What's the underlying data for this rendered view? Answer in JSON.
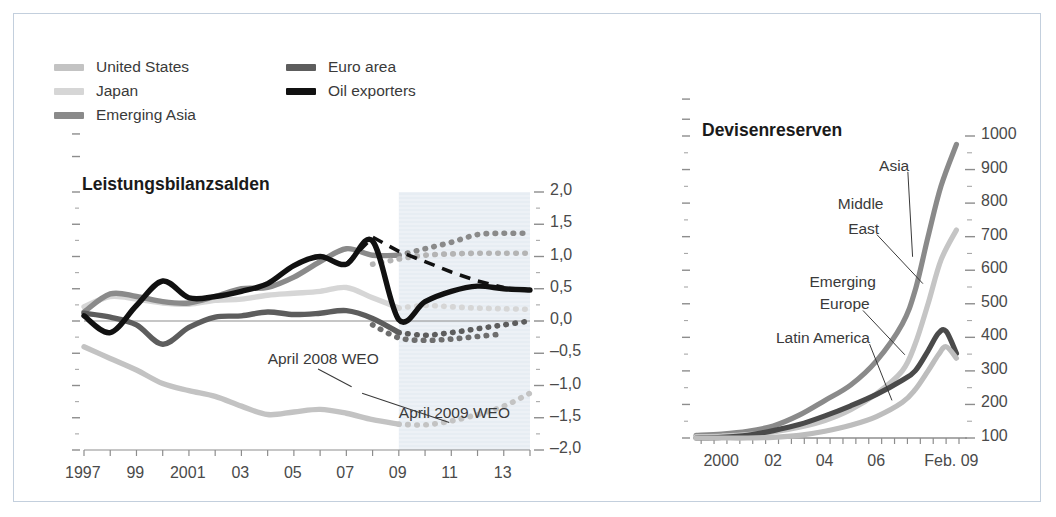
{
  "figure": {
    "border_color": "#c3cfdd",
    "background": "#ffffff"
  },
  "legend": {
    "items": [
      {
        "label": "United States",
        "color": "#c3c3c3",
        "col": 0,
        "row": 0
      },
      {
        "label": "Japan",
        "color": "#d6d6d6",
        "col": 0,
        "row": 1
      },
      {
        "label": "Emerging Asia",
        "color": "#8a8a8a",
        "col": 0,
        "row": 2
      },
      {
        "label": "Euro area",
        "color": "#5d5d5d",
        "col": 1,
        "row": 0
      },
      {
        "label": "Oil exporters",
        "color": "#111111",
        "col": 1,
        "row": 1
      }
    ]
  },
  "chart_data": [
    {
      "id": "leistungsbilanzsalden",
      "type": "line",
      "title": "Leistungsbilanzsalden",
      "xlabel": "",
      "ylabel": "",
      "xlim": [
        1997,
        2014
      ],
      "ylim": [
        -2.0,
        2.0
      ],
      "grid": false,
      "legend_position": "top-left-external",
      "decimal_separator": ",",
      "yticks": [
        2.0,
        1.5,
        1.0,
        0.5,
        0.0,
        -0.5,
        -1.0,
        -1.5,
        -2.0
      ],
      "ytick_labels": [
        "2,0",
        "1,5",
        "1,0",
        "0,5",
        "0,0",
        "-0,5",
        "-1,0",
        "-1,5",
        "-2,0"
      ],
      "xticks": [
        1997,
        1999,
        2001,
        2003,
        2005,
        2007,
        2009,
        2011,
        2013
      ],
      "xtick_labels": [
        "1997",
        "99",
        "2001",
        "03",
        "05",
        "07",
        "09",
        "11",
        "13"
      ],
      "forecast_shading": {
        "from": 2009,
        "to": 2014,
        "color": "#e7edf3"
      },
      "zero_line": 0.0,
      "annotations": [
        {
          "text": "April 2008 WEO",
          "x": 2004.0,
          "y": -0.62,
          "leader_to_x": 2007.2,
          "leader_to_y": -1.02
        },
        {
          "text": "April 2009 WEO",
          "x": 2009.0,
          "y": -1.45,
          "leader_to_x": 2007.6,
          "leader_to_y": -1.12
        }
      ],
      "series": [
        {
          "name": "United States",
          "color": "#c3c3c3",
          "style": "solid-then-dotted",
          "x": [
            1997,
            1998,
            1999,
            2000,
            2001,
            2002,
            2003,
            2004,
            2005,
            2006,
            2007,
            2008,
            2009,
            2010,
            2011,
            2012,
            2013,
            2014
          ],
          "values": [
            -0.4,
            -0.58,
            -0.76,
            -0.97,
            -1.08,
            -1.17,
            -1.32,
            -1.45,
            -1.41,
            -1.37,
            -1.43,
            -1.53,
            -1.6,
            -1.61,
            -1.55,
            -1.45,
            -1.32,
            -1.12
          ],
          "dotted_from": 2009
        },
        {
          "name": "Japan",
          "color": "#d6d6d6",
          "style": "solid-then-dotted",
          "x": [
            1997,
            1998,
            1999,
            2000,
            2001,
            2002,
            2003,
            2004,
            2005,
            2006,
            2007,
            2008,
            2009,
            2010,
            2011,
            2012,
            2013,
            2014
          ],
          "values": [
            0.22,
            0.38,
            0.34,
            0.28,
            0.26,
            0.32,
            0.34,
            0.4,
            0.43,
            0.46,
            0.52,
            0.36,
            0.2,
            0.24,
            0.22,
            0.2,
            0.19,
            0.18
          ],
          "dotted_from": 2009
        },
        {
          "name": "Emerging Asia",
          "color": "#8a8a8a",
          "style": "solid-then-dotted",
          "x": [
            1997,
            1998,
            1999,
            2000,
            2001,
            2002,
            2003,
            2004,
            2005,
            2006,
            2007,
            2008,
            2009,
            2010,
            2011,
            2012,
            2013,
            2014
          ],
          "values": [
            0.14,
            0.42,
            0.38,
            0.3,
            0.28,
            0.38,
            0.5,
            0.52,
            0.68,
            0.92,
            1.12,
            1.02,
            1.02,
            1.12,
            1.22,
            1.34,
            1.36,
            1.36
          ],
          "dotted_from": 2009
        },
        {
          "name": "Emerging Asia forecast 2009",
          "color": "#b4b4b4",
          "style": "dotted",
          "x": [
            2008,
            2009,
            2010,
            2011,
            2012,
            2013,
            2014
          ],
          "values": [
            0.88,
            0.96,
            1.02,
            1.04,
            1.05,
            1.05,
            1.05
          ]
        },
        {
          "name": "Euro area",
          "color": "#5d5d5d",
          "style": "solid-then-dotted",
          "x": [
            1997,
            1998,
            1999,
            2000,
            2001,
            2002,
            2003,
            2004,
            2005,
            2006,
            2007,
            2008,
            2009,
            2010,
            2011,
            2012,
            2013,
            2014
          ],
          "values": [
            0.12,
            0.06,
            -0.06,
            -0.36,
            -0.1,
            0.06,
            0.08,
            0.14,
            0.1,
            0.12,
            0.16,
            0.04,
            -0.18,
            -0.22,
            -0.18,
            -0.12,
            -0.06,
            0.0
          ],
          "dotted_from": 2009
        },
        {
          "name": "Euro area forecast 2009",
          "color": "#6e6e6e",
          "style": "dotted",
          "x": [
            2008,
            2009,
            2010,
            2011,
            2012,
            2013
          ],
          "values": [
            -0.06,
            -0.26,
            -0.3,
            -0.28,
            -0.24,
            -0.2
          ]
        },
        {
          "name": "Oil exporters",
          "color": "#111111",
          "style": "solid",
          "x": [
            1997,
            1998,
            1999,
            2000,
            2001,
            2002,
            2003,
            2004,
            2005,
            2006,
            2007,
            2008,
            2009,
            2010,
            2011,
            2012,
            2013,
            2014
          ],
          "values": [
            0.08,
            -0.18,
            0.24,
            0.62,
            0.36,
            0.38,
            0.46,
            0.58,
            0.86,
            1.0,
            0.88,
            1.24,
            0.02,
            0.3,
            0.46,
            0.54,
            0.5,
            0.48
          ]
        },
        {
          "name": "Oil exporters April 2008 WEO projection",
          "color": "#111111",
          "style": "dashed",
          "x": [
            2007,
            2008,
            2009,
            2010,
            2011,
            2012,
            2013
          ],
          "values": [
            0.88,
            1.3,
            1.08,
            0.92,
            0.76,
            0.62,
            0.52
          ]
        }
      ]
    },
    {
      "id": "devisenreserven",
      "type": "line",
      "title": "Devisenreserven",
      "xlabel": "",
      "ylabel": "",
      "xlim": [
        1999,
        2009.2
      ],
      "ylim": [
        100,
        1000
      ],
      "grid": false,
      "legend_position": "inline-labels",
      "yticks": [
        1000,
        900,
        800,
        700,
        600,
        500,
        400,
        300,
        200,
        100
      ],
      "ytick_labels": [
        "1000",
        "900",
        "800",
        "700",
        "600",
        "500",
        "400",
        "300",
        "200",
        "100"
      ],
      "xticks": [
        2000,
        2002,
        2004,
        2006,
        2009.1
      ],
      "xtick_labels": [
        "2000",
        "02",
        "04",
        "06",
        "Feb. 09"
      ],
      "baseline": 100,
      "annotations": [
        {
          "text": "Asia",
          "x": 2006.1,
          "y": 905,
          "leader_to_x": 2007.4,
          "leader_to_y": 640
        },
        {
          "text": "Middle",
          "x": 2004.5,
          "y": 790,
          "leader_to_x": null,
          "leader_to_y": null
        },
        {
          "text": "East",
          "x": 2004.9,
          "y": 718,
          "leader_to_x": 2007.8,
          "leader_to_y": 560
        },
        {
          "text": "Emerging",
          "x": 2003.4,
          "y": 560,
          "leader_to_x": null,
          "leader_to_y": null
        },
        {
          "text": "Europe",
          "x": 2003.8,
          "y": 492,
          "leader_to_x": 2007.1,
          "leader_to_y": 348
        },
        {
          "text": "Latin America",
          "x": 2002.1,
          "y": 392,
          "leader_to_x": 2006.6,
          "leader_to_y": 212
        }
      ],
      "series": [
        {
          "name": "Asia",
          "color": "#8a8a8a",
          "style": "solid",
          "x": [
            1999,
            2000,
            2001,
            2002,
            2003,
            2004,
            2005,
            2006,
            2007,
            2007.5,
            2008,
            2008.5,
            2009.1
          ],
          "values": [
            108,
            112,
            120,
            136,
            168,
            212,
            258,
            330,
            440,
            540,
            700,
            850,
            975
          ]
        },
        {
          "name": "Middle East",
          "color": "#c5c5c5",
          "style": "solid",
          "x": [
            1999,
            2000,
            2001,
            2002,
            2003,
            2004,
            2005,
            2006,
            2007,
            2007.5,
            2008,
            2008.5,
            2009.1
          ],
          "values": [
            104,
            106,
            110,
            118,
            132,
            152,
            184,
            232,
            300,
            380,
            500,
            630,
            720
          ]
        },
        {
          "name": "Emerging Europe",
          "color": "#4a4a4a",
          "style": "solid",
          "x": [
            1999,
            2000,
            2001,
            2002,
            2003,
            2004,
            2005,
            2006,
            2007,
            2007.5,
            2008,
            2008.4,
            2008.7,
            2009.1
          ],
          "values": [
            100,
            102,
            108,
            122,
            140,
            166,
            196,
            230,
            272,
            300,
            360,
            412,
            418,
            352
          ]
        },
        {
          "name": "Latin America",
          "color": "#bdbdbd",
          "style": "solid",
          "x": [
            1999,
            2000,
            2001,
            2002,
            2003,
            2004,
            2005,
            2006,
            2007,
            2007.5,
            2008,
            2008.4,
            2008.7,
            2009.1
          ],
          "values": [
            100,
            100,
            100,
            102,
            108,
            120,
            138,
            164,
            206,
            244,
            300,
            348,
            372,
            338
          ]
        }
      ]
    }
  ]
}
